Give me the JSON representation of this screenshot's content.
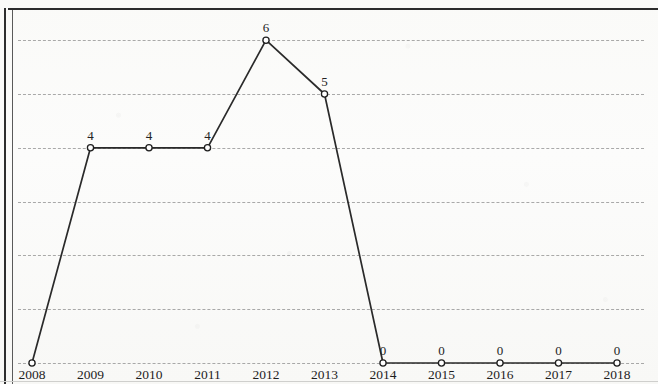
{
  "chart_data": {
    "type": "line",
    "title": "",
    "subtitle": "",
    "xlabel": "",
    "ylabel": "",
    "categories": [
      "2008",
      "2009",
      "2010",
      "2011",
      "2012",
      "2013",
      "2014",
      "2015",
      "2016",
      "2017",
      "2018"
    ],
    "values": [
      0,
      4,
      4,
      4,
      6,
      5,
      0,
      0,
      0,
      0,
      0
    ],
    "point_labels": [
      "",
      "4",
      "4",
      "4",
      "6",
      "5",
      "0",
      "0",
      "0",
      "0",
      "0"
    ],
    "series": [
      {
        "name": "",
        "values": [
          0,
          4,
          4,
          4,
          6,
          5,
          0,
          0,
          0,
          0,
          0
        ]
      }
    ],
    "ylim": [
      0,
      6.6
    ],
    "xlim": [
      "2008",
      "2018"
    ],
    "ytick_values": [
      0,
      1,
      2,
      3,
      4,
      5,
      6
    ],
    "ytick_labels": [],
    "grid": true,
    "grid_axis": "y",
    "grid_style": "dashed",
    "legend": false,
    "legend_position": "none",
    "marker": "open-circle",
    "line_color": "#2a2a2a",
    "marker_fill_color": "#ffffff",
    "marker_edge_color": "#1f1f1f",
    "grid_color": "#9b9b9b",
    "background_color": "#fbfbfa",
    "annotations": []
  },
  "page": {
    "border_color": "#2c2c2c"
  }
}
